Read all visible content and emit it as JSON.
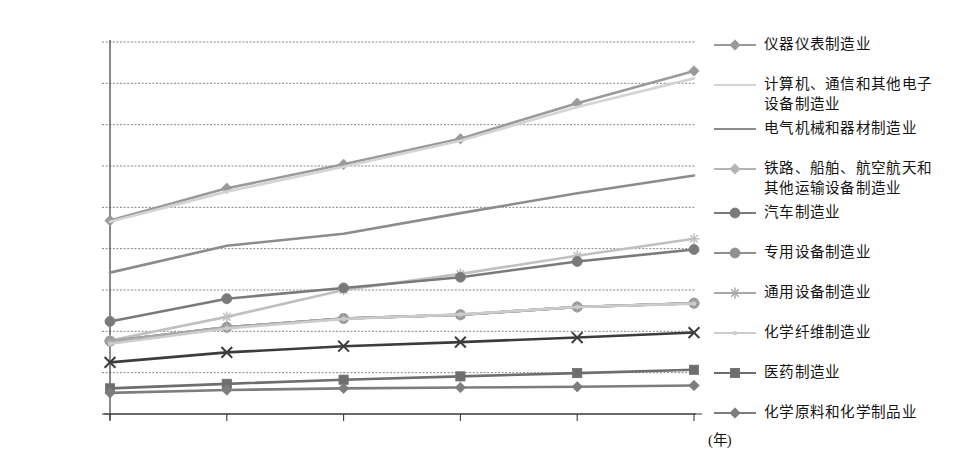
{
  "chart_data": {
    "type": "line",
    "title": "",
    "xlabel": "(年)",
    "ylabel": "",
    "grid": true,
    "legend_position": "right",
    "categories": [
      "2012",
      "2013",
      "2014",
      "2015",
      "2016",
      "2017"
    ],
    "x_tick_labels": [
      "2012",
      "2013",
      "2014",
      "2015",
      "2016",
      "2017"
    ],
    "y_tick_labels": [
      "90000",
      "80000",
      "70000",
      "60000",
      "50000",
      "40000",
      "30000",
      "20000",
      "10000",
      "0"
    ],
    "ylim": [
      0,
      90000
    ],
    "y_step": 10000,
    "series": [
      {
        "name": "仪器仪表制造业",
        "legend_label": "仪器仪表制造业",
        "marker": "diamond",
        "color": "#9a9a9a",
        "values": [
          46800,
          54600,
          60400,
          66600,
          75200,
          83000
        ]
      },
      {
        "name": "计算机、通信和其他电子设备制造业",
        "legend_label": "计算机、通信和其他电子\n设备制造业",
        "marker": "none",
        "color": "#d4d4d4",
        "values": [
          46500,
          53800,
          59800,
          66100,
          74300,
          81200
        ]
      },
      {
        "name": "电气机械和器材制造业",
        "legend_label": "电气机械和器材制造业",
        "marker": "none",
        "color": "#8c8c8c",
        "values": [
          34200,
          40700,
          43600,
          48600,
          53400,
          57700
        ]
      },
      {
        "name": "铁路、船舶、航空航天和其他运输设备制造业",
        "legend_label": "铁路、船舶、航空航天和\n其他运输设备制造业",
        "marker": "diamond",
        "color": "#b4b4b4",
        "values": [
          17600,
          21000,
          23100,
          24000,
          25900,
          26800
        ]
      },
      {
        "name": "汽车制造业",
        "legend_label": "汽车制造业",
        "marker": "circle",
        "color": "#7a7a7a",
        "values": [
          22400,
          27900,
          30500,
          33100,
          36900,
          39800
        ]
      },
      {
        "name": "专用设备制造业",
        "legend_label": "专用设备制造业",
        "marker": "circle",
        "color": "#8f8f8f",
        "values": [
          17600,
          21000,
          23100,
          24000,
          25900,
          26800
        ]
      },
      {
        "name": "通用设备制造业",
        "legend_label": "通用设备制造业",
        "marker": "star",
        "color": "#a8a8a8",
        "values": [
          17600,
          21000,
          23100,
          24000,
          25900,
          26800
        ]
      },
      {
        "name": "化学纤维制造业",
        "legend_label": "化学纤维制造业",
        "marker": "dot",
        "color": "#cccccc",
        "values": [
          17000,
          20700,
          23000,
          24100,
          25900,
          26700
        ]
      },
      {
        "name": "医药制造业",
        "legend_label": "医药制造业",
        "marker": "square",
        "color": "#6e6e6e",
        "values": [
          6200,
          7300,
          8300,
          9100,
          9900,
          10700
        ]
      },
      {
        "name": "化学原料和化学制品业",
        "legend_label": "化学原料和化学制品业",
        "marker": "diamond",
        "color": "#7d7d7d",
        "values": [
          5100,
          5800,
          6200,
          6400,
          6600,
          6900
        ]
      }
    ],
    "extra_series": [
      {
        "name": "通用设备制造业-line",
        "marker": "x",
        "color": "#3c3c3c",
        "values": [
          12500,
          14900,
          16400,
          17400,
          18500,
          19700
        ]
      },
      {
        "name": "专用设备制造业-line",
        "marker": "star",
        "color": "#a0a0a0",
        "values": [
          17600,
          21000,
          23100,
          24000,
          25900,
          26800
        ]
      },
      {
        "name": "化学纤维-upper",
        "marker": "star",
        "color": "#c0c0c0",
        "values": [
          17800,
          23500,
          30000,
          33900,
          38300,
          42400
        ]
      }
    ],
    "colors": {
      "axis": "#3a3a3a",
      "grid": "#777777",
      "background": "#ffffff",
      "text": "#141414"
    }
  }
}
